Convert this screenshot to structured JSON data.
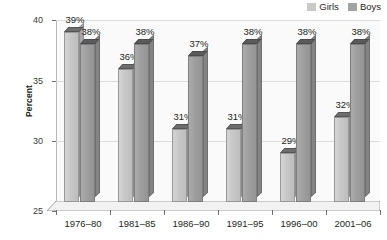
{
  "legend": {
    "position": "top-right",
    "items": [
      {
        "label": "Girls",
        "color": "#c9c9c9",
        "swatch_name": "legend-swatch-girls"
      },
      {
        "label": "Boys",
        "color": "#a3a3a3",
        "swatch_name": "legend-swatch-boys"
      }
    ]
  },
  "axis": {
    "ylabel": "Percent",
    "yticks": [
      "25",
      "30",
      "35",
      "40"
    ]
  },
  "chart_data": {
    "type": "bar",
    "title": "",
    "subtitle": "",
    "xlabel": "",
    "ylabel": "Percent",
    "ylim": [
      25,
      40
    ],
    "yticks": [
      25,
      30,
      35,
      40
    ],
    "grid": true,
    "legend_position": "top-right",
    "categories": [
      "1976–80",
      "1981–85",
      "1986–90",
      "1991–95",
      "1996–00",
      "2001–06"
    ],
    "series": [
      {
        "name": "Girls",
        "color": "#c9c9c9",
        "values": [
          39,
          36,
          31,
          31,
          29,
          32
        ],
        "data_labels": [
          "39%",
          "36%",
          "31%",
          "31%",
          "29%",
          "32%"
        ]
      },
      {
        "name": "Boys",
        "color": "#a3a3a3",
        "values": [
          38,
          38,
          37,
          38,
          38,
          38
        ],
        "data_labels": [
          "38%",
          "38%",
          "37%",
          "38%",
          "38%",
          "38%"
        ]
      }
    ]
  }
}
